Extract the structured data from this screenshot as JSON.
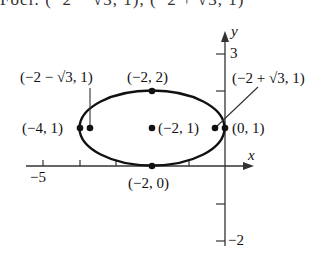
{
  "header": {
    "cut_text": "Foci: (−2 − √3, 1), (−2 + √3, 1)"
  },
  "axes": {
    "x_label": "x",
    "y_label": "y",
    "x_tick_label_min": "−5",
    "y_tick_label_top": "3",
    "y_tick_label_bottom": "−2"
  },
  "points": {
    "left_vertex": "(−4, 1)",
    "left_focus": "(−2 − √3, 1)",
    "top_covertex": "(−2, 2)",
    "center": "(−2, 1)",
    "right_vertex": "(0, 1)",
    "right_focus": "(−2 + √3, 1)",
    "bottom_covertex": "(−2, 0)"
  },
  "colors": {
    "curve": "#111111",
    "axis": "#333333"
  }
}
